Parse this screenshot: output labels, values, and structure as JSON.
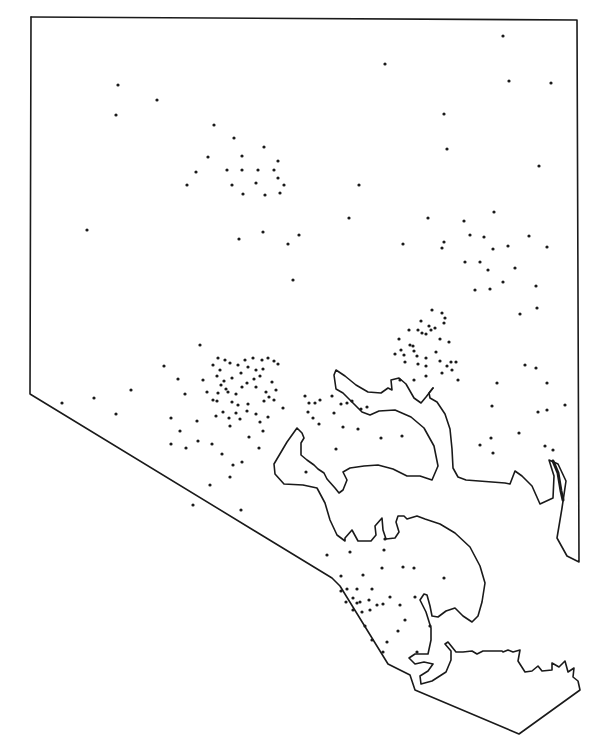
{
  "map": {
    "title": "",
    "type": "dot-distribution",
    "colors": {
      "line": "#1a1a1a",
      "background": "#ffffff",
      "dot": "#1a1a1a"
    },
    "dot_radius": 1.6,
    "boundary": "M31,17 L577,20 L579,562 L567,556 L557,538 L562,508 L566,481 L558,464 L549,460 L554,476 L553,498 L540,504 L532,486 L522,476 L515,471 L510,484 L505,483 L466,480 L458,477 L453,468 L452,449 L450,429 L445,414 L437,402 L430,398 L429,393 L433,388",
    "outline_south": "M30,394 L31,17 M30,394 L332,578 L340,586 L388,664 L410,675 L415,690 L519,734 L580,690 L578,681 L573,677 L574,668 L568,672 L565,661 L559,667 L552,663 L552,670 L542,671 L538,666 L532,671 L525,672 L518,661 L520,650 L513,652 L508,650 L503,652 L502,651 L483,651 L477,654 L472,651 L463,652 L456,652 L448,642 L445,644 L451,651 L451,660 L446,672 L432,681 L421,684 L420,676 L428,671 L433,664 L424,662 L415,664 L409,658 L415,654 L428,654 L431,640 L431,628 L426,612 L420,600 L424,594 L427,595 L430,606 L432,616 L438,617 L446,611 L455,608 L463,616 L472,622 L478,616 L482,602 L485,583 L480,566 L470,547 L455,533 L440,524 L425,519 L417,516 L407,519 L404,516 L398,516 L396,522 L399,532 L395,538 L386,539 L383,530 L382,518 L375,526 L376,535 L371,541 L358,541 L352,530 L345,538 L345,541 L337,535 L330,520 L325,503 L317,488 L303,485 L284,484 L275,474 L274,464 L287,442 L297,428 L302,433 L304,438 L301,443 L301,455 L307,460 L314,465 L318,469 L324,473 L327,479 L335,488 L339,493 L343,490 L347,480 L343,472 L350,468 L364,466 L378,465 L393,469 L407,476 L420,476 L432,480 L438,466 L434,446 L424,428 L411,417 L395,410 L379,411 L370,415 L362,412 L350,400 L343,393 L336,389 L334,375 L336,370 L345,376 L356,385 L368,392 L381,393 L388,388 L392,390 L391,380 L399,378 L406,384 L414,398 L421,403 L426,397 L433,388",
    "islands": [
      "M553,461 L558,473 L561,491 L563,500"
    ],
    "dots": [
      [
        503,
        36
      ],
      [
        385,
        64
      ],
      [
        509,
        81
      ],
      [
        551,
        83
      ],
      [
        118,
        85
      ],
      [
        157,
        100
      ],
      [
        116,
        115
      ],
      [
        444,
        114
      ],
      [
        214,
        125
      ],
      [
        234,
        138
      ],
      [
        264,
        147
      ],
      [
        447,
        149
      ],
      [
        208,
        157
      ],
      [
        242,
        156
      ],
      [
        278,
        161
      ],
      [
        196,
        172
      ],
      [
        227,
        170
      ],
      [
        242,
        170
      ],
      [
        258,
        170
      ],
      [
        274,
        170
      ],
      [
        278,
        178
      ],
      [
        232,
        185
      ],
      [
        256,
        183
      ],
      [
        284,
        185
      ],
      [
        243,
        194
      ],
      [
        280,
        193
      ],
      [
        187,
        185
      ],
      [
        359,
        185
      ],
      [
        539,
        166
      ],
      [
        265,
        195
      ],
      [
        428,
        218
      ],
      [
        464,
        221
      ],
      [
        494,
        212
      ],
      [
        87,
        230
      ],
      [
        349,
        218
      ],
      [
        239,
        239
      ],
      [
        263,
        232
      ],
      [
        288,
        244
      ],
      [
        299,
        235
      ],
      [
        470,
        235
      ],
      [
        444,
        242
      ],
      [
        484,
        237
      ],
      [
        529,
        236
      ],
      [
        403,
        244
      ],
      [
        508,
        246
      ],
      [
        293,
        280
      ],
      [
        442,
        248
      ],
      [
        493,
        249
      ],
      [
        547,
        247
      ],
      [
        465,
        262
      ],
      [
        480,
        262
      ],
      [
        488,
        270
      ],
      [
        515,
        268
      ],
      [
        475,
        290
      ],
      [
        490,
        289
      ],
      [
        503,
        282
      ],
      [
        536,
        286
      ],
      [
        432,
        310
      ],
      [
        442,
        313
      ],
      [
        445,
        318
      ],
      [
        520,
        314
      ],
      [
        537,
        308
      ],
      [
        421,
        321
      ],
      [
        429,
        326
      ],
      [
        435,
        328
      ],
      [
        409,
        330
      ],
      [
        418,
        330
      ],
      [
        422,
        333
      ],
      [
        431,
        330
      ],
      [
        444,
        323
      ],
      [
        399,
        339
      ],
      [
        413,
        346
      ],
      [
        426,
        334
      ],
      [
        440,
        339
      ],
      [
        449,
        342
      ],
      [
        401,
        350
      ],
      [
        404,
        355
      ],
      [
        410,
        345
      ],
      [
        414,
        351
      ],
      [
        417,
        356
      ],
      [
        426,
        358
      ],
      [
        436,
        352
      ],
      [
        447,
        366
      ],
      [
        456,
        362
      ],
      [
        395,
        354
      ],
      [
        405,
        362
      ],
      [
        418,
        364
      ],
      [
        426,
        366
      ],
      [
        440,
        361
      ],
      [
        451,
        362
      ],
      [
        400,
        380
      ],
      [
        414,
        380
      ],
      [
        426,
        376
      ],
      [
        442,
        373
      ],
      [
        452,
        370
      ],
      [
        458,
        380
      ],
      [
        497,
        383
      ],
      [
        547,
        383
      ],
      [
        525,
        365
      ],
      [
        536,
        368
      ],
      [
        492,
        406
      ],
      [
        538,
        412
      ],
      [
        491,
        438
      ],
      [
        519,
        433
      ],
      [
        547,
        410
      ],
      [
        565,
        405
      ],
      [
        545,
        446
      ],
      [
        480,
        445
      ],
      [
        493,
        453
      ],
      [
        553,
        450
      ],
      [
        200,
        345
      ],
      [
        164,
        366
      ],
      [
        203,
        380
      ],
      [
        213,
        365
      ],
      [
        218,
        358
      ],
      [
        225,
        360
      ],
      [
        230,
        363
      ],
      [
        220,
        370
      ],
      [
        217,
        376
      ],
      [
        221,
        385
      ],
      [
        226,
        389
      ],
      [
        232,
        378
      ],
      [
        238,
        365
      ],
      [
        241,
        373
      ],
      [
        245,
        360
      ],
      [
        248,
        367
      ],
      [
        253,
        358
      ],
      [
        256,
        370
      ],
      [
        262,
        360
      ],
      [
        268,
        358
      ],
      [
        274,
        361
      ],
      [
        278,
        364
      ],
      [
        263,
        369
      ],
      [
        260,
        376
      ],
      [
        254,
        379
      ],
      [
        247,
        383
      ],
      [
        242,
        387
      ],
      [
        236,
        394
      ],
      [
        228,
        392
      ],
      [
        224,
        381
      ],
      [
        218,
        393
      ],
      [
        213,
        400
      ],
      [
        207,
        392
      ],
      [
        256,
        387
      ],
      [
        266,
        392
      ],
      [
        272,
        382
      ],
      [
        269,
        397
      ],
      [
        276,
        390
      ],
      [
        217,
        401
      ],
      [
        264,
        401
      ],
      [
        268,
        417
      ],
      [
        248,
        404
      ],
      [
        238,
        405
      ],
      [
        232,
        402
      ],
      [
        223,
        412
      ],
      [
        236,
        413
      ],
      [
        247,
        411
      ],
      [
        256,
        414
      ],
      [
        240,
        419
      ],
      [
        229,
        418
      ],
      [
        216,
        416
      ],
      [
        230,
        426
      ],
      [
        260,
        422
      ],
      [
        274,
        400
      ],
      [
        263,
        431
      ],
      [
        259,
        448
      ],
      [
        242,
        462
      ],
      [
        233,
        465
      ],
      [
        212,
        444
      ],
      [
        222,
        454
      ],
      [
        249,
        437
      ],
      [
        131,
        390
      ],
      [
        94,
        398
      ],
      [
        62,
        403
      ],
      [
        116,
        414
      ],
      [
        178,
        379
      ],
      [
        171,
        418
      ],
      [
        185,
        394
      ],
      [
        197,
        421
      ],
      [
        180,
        431
      ],
      [
        171,
        444
      ],
      [
        186,
        448
      ],
      [
        198,
        441
      ],
      [
        210,
        485
      ],
      [
        230,
        477
      ],
      [
        241,
        510
      ],
      [
        193,
        505
      ],
      [
        283,
        408
      ],
      [
        305,
        396
      ],
      [
        309,
        403
      ],
      [
        315,
        403
      ],
      [
        320,
        400
      ],
      [
        308,
        412
      ],
      [
        313,
        418
      ],
      [
        332,
        396
      ],
      [
        341,
        404
      ],
      [
        347,
        403
      ],
      [
        352,
        401
      ],
      [
        319,
        424
      ],
      [
        334,
        413
      ],
      [
        343,
        427
      ],
      [
        361,
        409
      ],
      [
        336,
        449
      ],
      [
        367,
        407
      ],
      [
        358,
        429
      ],
      [
        381,
        438
      ],
      [
        402,
        436
      ],
      [
        306,
        472
      ],
      [
        327,
        555
      ],
      [
        350,
        552
      ],
      [
        385,
        539
      ],
      [
        341,
        576
      ],
      [
        363,
        575
      ],
      [
        341,
        591
      ],
      [
        347,
        589
      ],
      [
        357,
        589
      ],
      [
        372,
        589
      ],
      [
        346,
        602
      ],
      [
        353,
        598
      ],
      [
        360,
        602
      ],
      [
        362,
        612
      ],
      [
        369,
        600
      ],
      [
        377,
        605
      ],
      [
        383,
        604
      ],
      [
        390,
        597
      ],
      [
        400,
        605
      ],
      [
        415,
        597
      ],
      [
        405,
        620
      ],
      [
        398,
        631
      ],
      [
        387,
        642
      ],
      [
        372,
        640
      ],
      [
        357,
        603
      ],
      [
        353,
        610
      ],
      [
        365,
        626
      ],
      [
        444,
        578
      ],
      [
        382,
        568
      ],
      [
        403,
        567
      ],
      [
        430,
        626
      ],
      [
        417,
        652
      ],
      [
        384,
        550
      ],
      [
        370,
        610
      ],
      [
        383,
        652
      ],
      [
        414,
        568
      ]
    ]
  }
}
